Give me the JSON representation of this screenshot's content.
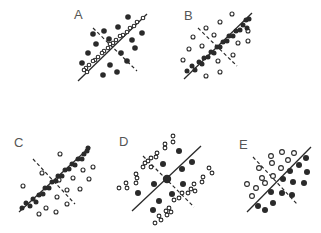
{
  "figure": {
    "width": 321,
    "height": 233,
    "colors": {
      "ink": "#2a2a2a",
      "label": "#555555",
      "background": "#ffffff"
    },
    "panels": [
      {
        "id": "A",
        "label": "A",
        "label_pos": [
          74,
          19
        ],
        "solid_line": [
          [
            78,
            81
          ],
          [
            147,
            14
          ]
        ],
        "dashed_line": [
          [
            93,
            28
          ],
          [
            137,
            71
          ]
        ],
        "filled_points": [
          [
            128,
            17
          ],
          [
            118,
            27
          ],
          [
            104,
            31
          ],
          [
            93,
            34
          ],
          [
            142,
            33
          ],
          [
            109,
            39
          ],
          [
            96,
            44
          ],
          [
            132,
            40
          ],
          [
            135,
            48
          ],
          [
            88,
            53
          ],
          [
            121,
            53
          ],
          [
            82,
            63
          ],
          [
            127,
            61
          ],
          [
            110,
            65
          ],
          [
            103,
            75
          ],
          [
            117,
            72
          ]
        ],
        "open_points": [
          [
            143,
            18
          ],
          [
            137,
            22
          ],
          [
            134,
            26
          ],
          [
            130,
            28
          ],
          [
            127,
            32
          ],
          [
            123,
            35
          ],
          [
            120,
            36
          ],
          [
            116,
            40
          ],
          [
            113,
            43
          ],
          [
            110,
            44
          ],
          [
            108,
            48
          ],
          [
            104,
            51
          ],
          [
            102,
            53
          ],
          [
            98,
            57
          ],
          [
            95,
            60
          ],
          [
            93,
            61
          ],
          [
            89,
            65
          ],
          [
            86,
            68
          ],
          [
            84,
            70
          ],
          [
            87,
            72
          ]
        ],
        "filled_r": 2.8,
        "open_r": 1.8
      },
      {
        "id": "B",
        "label": "B",
        "label_pos": [
          184,
          20
        ],
        "solid_line": [
          [
            184,
            79
          ],
          [
            252,
            13
          ]
        ],
        "dashed_line": [
          [
            198,
            28
          ],
          [
            237,
            66
          ]
        ],
        "open_points": [
          [
            232,
            14
          ],
          [
            220,
            22
          ],
          [
            206,
            28
          ],
          [
            193,
            37
          ],
          [
            214,
            35
          ],
          [
            202,
            46
          ],
          [
            189,
            49
          ],
          [
            238,
            43
          ],
          [
            248,
            31
          ],
          [
            248,
            41
          ],
          [
            183,
            60
          ],
          [
            218,
            61
          ],
          [
            233,
            55
          ],
          [
            220,
            72
          ],
          [
            206,
            76
          ]
        ],
        "filled_points": [
          [
            187,
            71
          ],
          [
            192,
            66
          ],
          [
            195,
            70
          ],
          [
            199,
            62
          ],
          [
            202,
            64
          ],
          [
            204,
            58
          ],
          [
            208,
            57
          ],
          [
            211,
            52
          ],
          [
            214,
            53
          ],
          [
            217,
            47
          ],
          [
            220,
            47
          ],
          [
            223,
            42
          ],
          [
            227,
            41
          ],
          [
            229,
            36
          ],
          [
            233,
            36
          ],
          [
            236,
            31
          ],
          [
            240,
            30
          ],
          [
            243,
            25
          ],
          [
            247,
            28
          ],
          [
            249,
            19
          ],
          [
            246,
            20
          ]
        ],
        "filled_r": 2.5,
        "open_r": 2.0
      },
      {
        "id": "C",
        "label": "C",
        "label_pos": [
          14,
          147
        ],
        "solid_line": [
          [
            19,
            212
          ],
          [
            90,
            147
          ]
        ],
        "dashed_line": [
          [
            33,
            159
          ],
          [
            75,
            204
          ]
        ],
        "filled_points": [
          [
            22,
            208
          ],
          [
            26,
            203
          ],
          [
            30,
            206
          ],
          [
            33,
            199
          ],
          [
            36,
            202
          ],
          [
            39,
            195
          ],
          [
            43,
            194
          ],
          [
            45,
            188
          ],
          [
            49,
            188
          ],
          [
            52,
            182
          ],
          [
            56,
            181
          ],
          [
            58,
            176
          ],
          [
            62,
            176
          ],
          [
            65,
            170
          ],
          [
            69,
            169
          ],
          [
            72,
            164
          ],
          [
            75,
            165
          ],
          [
            78,
            159
          ],
          [
            82,
            159
          ],
          [
            84,
            154
          ],
          [
            87,
            151
          ],
          [
            88,
            148
          ]
        ],
        "open_points": [
          [
            60,
            154
          ],
          [
            93,
            167
          ],
          [
            83,
            170
          ],
          [
            42,
            173
          ],
          [
            23,
            186
          ],
          [
            73,
            178
          ],
          [
            89,
            179
          ],
          [
            59,
            180
          ],
          [
            80,
            189
          ],
          [
            67,
            190
          ],
          [
            57,
            197
          ],
          [
            67,
            204
          ],
          [
            46,
            208
          ],
          [
            56,
            212
          ],
          [
            39,
            214
          ]
        ],
        "filled_r": 2.5,
        "open_r": 2.0
      },
      {
        "id": "D",
        "label": "D",
        "label_pos": [
          119,
          146
        ],
        "solid_line": [
          [
            132,
            211
          ],
          [
            201,
            146
          ]
        ],
        "dashed_line": [
          [
            143,
            156
          ],
          [
            194,
            207
          ]
        ],
        "filled_points": [
          [
            179,
            151
          ],
          [
            192,
            162
          ],
          [
            163,
            164
          ],
          [
            182,
            169
          ],
          [
            154,
            184
          ],
          [
            183,
            184
          ],
          [
            138,
            193
          ],
          [
            172,
            194
          ],
          [
            159,
            201
          ],
          [
            153,
            210
          ]
        ],
        "center_point": [
          167,
          179
        ],
        "open_points": [
          [
            173,
            136
          ],
          [
            165,
            144
          ],
          [
            173,
            142
          ],
          [
            165,
            148
          ],
          [
            157,
            153
          ],
          [
            156,
            157
          ],
          [
            151,
            158
          ],
          [
            148,
            161
          ],
          [
            145,
            163
          ],
          [
            143,
            167
          ],
          [
            151,
            167
          ],
          [
            136,
            174
          ],
          [
            137,
            178
          ],
          [
            136,
            183
          ],
          [
            126,
            183
          ],
          [
            127,
            188
          ],
          [
            119,
            188
          ],
          [
            209,
            168
          ],
          [
            212,
            173
          ],
          [
            203,
            177
          ],
          [
            202,
            182
          ],
          [
            194,
            184
          ],
          [
            191,
            189
          ],
          [
            195,
            191
          ],
          [
            188,
            193
          ],
          [
            182,
            193
          ],
          [
            179,
            198
          ],
          [
            174,
            200
          ],
          [
            169,
            208
          ],
          [
            166,
            211
          ],
          [
            171,
            212
          ],
          [
            167,
            215
          ],
          [
            159,
            216
          ],
          [
            161,
            220
          ],
          [
            155,
            223
          ]
        ],
        "filled_r": 3.0,
        "center_r": 4.2,
        "open_r": 1.9
      },
      {
        "id": "E",
        "label": "E",
        "label_pos": [
          239,
          149
        ],
        "solid_line": [
          [
            247,
            212
          ],
          [
            311,
            147
          ]
        ],
        "dashed_line": [
          [
            253,
            157
          ],
          [
            297,
            204
          ]
        ],
        "open_points": [
          [
            271,
            156
          ],
          [
            282,
            152
          ],
          [
            294,
            153
          ],
          [
            259,
            168
          ],
          [
            272,
            163
          ],
          [
            288,
            160
          ],
          [
            281,
            168
          ],
          [
            273,
            176
          ],
          [
            262,
            178
          ],
          [
            265,
            183
          ],
          [
            247,
            184
          ],
          [
            256,
            188
          ],
          [
            252,
            196
          ]
        ],
        "filled_points": [
          [
            306,
            158
          ],
          [
            299,
            165
          ],
          [
            307,
            172
          ],
          [
            290,
            171
          ],
          [
            283,
            179
          ],
          [
            293,
            182
          ],
          [
            304,
            183
          ],
          [
            271,
            192
          ],
          [
            282,
            193
          ],
          [
            292,
            195
          ],
          [
            273,
            203
          ],
          [
            258,
            206
          ],
          [
            265,
            210
          ]
        ],
        "filled_r": 3.0,
        "open_r": 2.4
      }
    ]
  }
}
